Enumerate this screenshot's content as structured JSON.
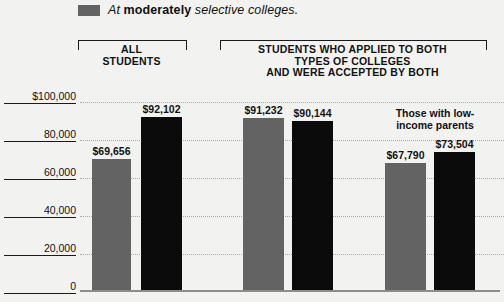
{
  "legend": {
    "swatch_color": "#636363",
    "prefix": "At ",
    "emphasis": "moderately",
    "suffix": " selective colleges."
  },
  "groups": [
    {
      "id": "all-students",
      "label": "ALL\nSTUDENTS"
    },
    {
      "id": "applied-both",
      "label": "STUDENTS WHO APPLIED TO BOTH\nTYPES OF COLLEGES\nAND WERE ACCEPTED BY BOTH"
    }
  ],
  "annotation": {
    "text": "Those with low-\nincome parents"
  },
  "chart_data": {
    "type": "bar",
    "title": "",
    "xlabel": "",
    "ylabel": "",
    "ylim": [
      0,
      100000
    ],
    "grid": true,
    "legend_position": "top-left",
    "ytick_labels": [
      "$100,000",
      "80,000",
      "60,000",
      "40,000",
      "20,000",
      "0"
    ],
    "ytick_values": [
      100000,
      80000,
      60000,
      40000,
      20000,
      0
    ],
    "categories": [
      "All students",
      "Applied to both types (all)",
      "Applied to both types (low-income parents)"
    ],
    "series": [
      {
        "name": "At moderately selective colleges",
        "color": "#636363",
        "values": [
          69656,
          91232,
          67790
        ]
      },
      {
        "name": "Other",
        "color": "#0b0b0b",
        "values": [
          92102,
          90144,
          73504
        ]
      }
    ],
    "bars": [
      {
        "group": 0,
        "series": 0,
        "value": 69656,
        "label": "$69,656",
        "color": "#636363"
      },
      {
        "group": 0,
        "series": 1,
        "value": 92102,
        "label": "$92,102",
        "color": "#0b0b0b"
      },
      {
        "group": 1,
        "series": 0,
        "value": 91232,
        "label": "$91,232",
        "color": "#636363"
      },
      {
        "group": 1,
        "series": 1,
        "value": 90144,
        "label": "$90,144",
        "color": "#0b0b0b"
      },
      {
        "group": 2,
        "series": 0,
        "value": 67790,
        "label": "$67,790",
        "color": "#636363"
      },
      {
        "group": 2,
        "series": 1,
        "value": 73504,
        "label": "$73,504",
        "color": "#0b0b0b"
      }
    ]
  }
}
